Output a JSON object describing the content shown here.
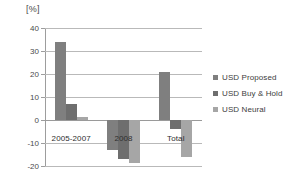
{
  "chart_data": {
    "type": "bar",
    "title": "",
    "subtitle": "",
    "unit_label": "[%]",
    "xlabel": "",
    "ylabel": "[%]",
    "categories": [
      "2005-2007",
      "2008",
      "Total"
    ],
    "series": [
      {
        "name": "USD Proposed",
        "color": "#7f7f7f",
        "values": [
          34,
          -13,
          21
        ]
      },
      {
        "name": "USD Buy & Hold",
        "color": "#6e6e6e",
        "values": [
          7,
          -17,
          -4
        ]
      },
      {
        "name": "USD Neural",
        "color": "#a6a6a6",
        "values": [
          1.5,
          -18.5,
          -16
        ]
      }
    ],
    "ylim": [
      -20,
      40
    ],
    "yticks": [
      40,
      30,
      20,
      10,
      0,
      -10,
      -20
    ],
    "ytick_labels": [
      "40",
      "30",
      "20",
      "10",
      "0",
      "-10",
      "-20"
    ],
    "grid": true,
    "legend_position": "right",
    "legend_entries": [
      "USD Proposed",
      "USD Buy & Hold",
      "USD Neural"
    ],
    "annotations": []
  },
  "colors": {
    "gridline": "#b9b9b9",
    "axis": "#9d9d9d",
    "text": "#3a3a3a",
    "background": "#ffffff"
  }
}
